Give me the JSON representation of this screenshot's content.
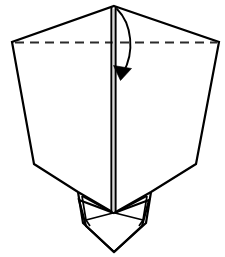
{
  "figure": {
    "background_color": "#ffffff",
    "line_color": "#000000",
    "crease_color": "#2b2b2b",
    "spine_highlight_color": "#d8d8d8",
    "canvas": {
      "width": 225,
      "height": 257
    }
  },
  "legend": {
    "solid_line_meaning": "paper edge",
    "dashed_line_meaning": "valley fold crease",
    "arrow_meaning": "fold direction"
  },
  "geometry": {
    "apex": {
      "x": 114,
      "y": 6
    },
    "left_corner": {
      "x": 12,
      "y": 42
    },
    "right_corner": {
      "x": 219,
      "y": 42
    },
    "left_shoulder": {
      "x": 34,
      "y": 164
    },
    "right_shoulder": {
      "x": 196,
      "y": 164
    },
    "body_bottom_left": {
      "x": 78,
      "y": 192
    },
    "body_bottom_right": {
      "x": 151,
      "y": 192
    },
    "bottom_point": {
      "x": 114,
      "y": 252
    },
    "spine_top": {
      "x": 113.5,
      "y": 7
    },
    "spine_bottom": {
      "x": 113.5,
      "y": 213
    }
  },
  "shapes": {
    "main_body_path": "M 114 6 L 219 42 L 196 164 L 151 192 L 114 213 L 78 192 L 34 164 L 12 42 Z",
    "crease_line": {
      "x1": 15,
      "y1": 42.5,
      "x2": 217,
      "y2": 42.5
    },
    "spine_left_line": {
      "x": 111.4,
      "y1": 7,
      "y2": 213
    },
    "spine_gap_line": {
      "x": 113.6,
      "y1": 9,
      "y2": 212
    },
    "spine_right_line": {
      "x": 115.6,
      "y1": 7,
      "y2": 213
    },
    "lower_diamond_path": "M 114 213 L 149 200 L 142 226 L 114 252 L 86 226 L 79 200 Z",
    "left_flap_outer_path": "M 78 192 L 83 223 L 114 252",
    "left_flap_inner_path": "M 82 196 L 86 220 L 113 213",
    "left_flap_fold_path": "M 82 196 L 113 213",
    "left_flap_edge_path": "M 86 220 L 90 226",
    "right_flap_outer_path": "M 151 192 L 146 223 L 114 252",
    "right_flap_inner_path": "M 147 196 L 143 220 L 115 213",
    "right_flap_fold_path": "M 147 196 L 115 213",
    "right_flap_edge_path": "M 143 220 L 139 226",
    "arrow_curve_path": "M 117 9 C 132 24 135 52 123 73",
    "arrow_head_points": "120.5,80.5 113.5,65.5 131.5,68.5"
  },
  "labels": {
    "figure_caption": "",
    "step_number": ""
  }
}
